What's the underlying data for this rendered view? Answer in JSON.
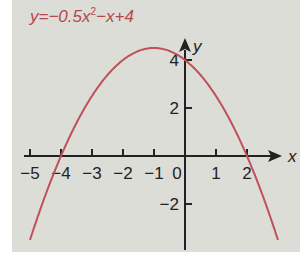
{
  "chart_data": {
    "type": "line",
    "equation": {
      "a": -0.5,
      "b": -1,
      "c": 4
    },
    "xlabel": "x",
    "ylabel": "y",
    "xlim": [
      -5.5,
      3
    ],
    "ylim": [
      -3.6,
      4.9
    ],
    "x_ticks": [
      -5,
      -4,
      -3,
      -2,
      -1,
      0,
      1,
      2
    ],
    "x_tick_labels": [
      "−5",
      "−4",
      "−3",
      "−2",
      "−1",
      "0",
      "1",
      "2"
    ],
    "y_ticks": [
      4,
      2,
      -2
    ],
    "y_tick_labels": [
      "4",
      "2",
      "−2"
    ],
    "series": [
      {
        "name": "y=−0.5x²−x+4",
        "color": "#c0505a",
        "x": [
          -5,
          -4,
          -3,
          -2,
          -1,
          0,
          1,
          2,
          3
        ],
        "y": [
          -3.5,
          0,
          2.5,
          4,
          4.5,
          4,
          2.5,
          0,
          -3.5
        ]
      }
    ],
    "roots": [
      -4,
      2
    ],
    "vertex": [
      -1,
      4.5
    ],
    "grid": false
  },
  "labels": {
    "eq_prefix": "y=−0.5",
    "eq_x": "x",
    "eq_sup": "2",
    "eq_suffix": "−x+4"
  }
}
